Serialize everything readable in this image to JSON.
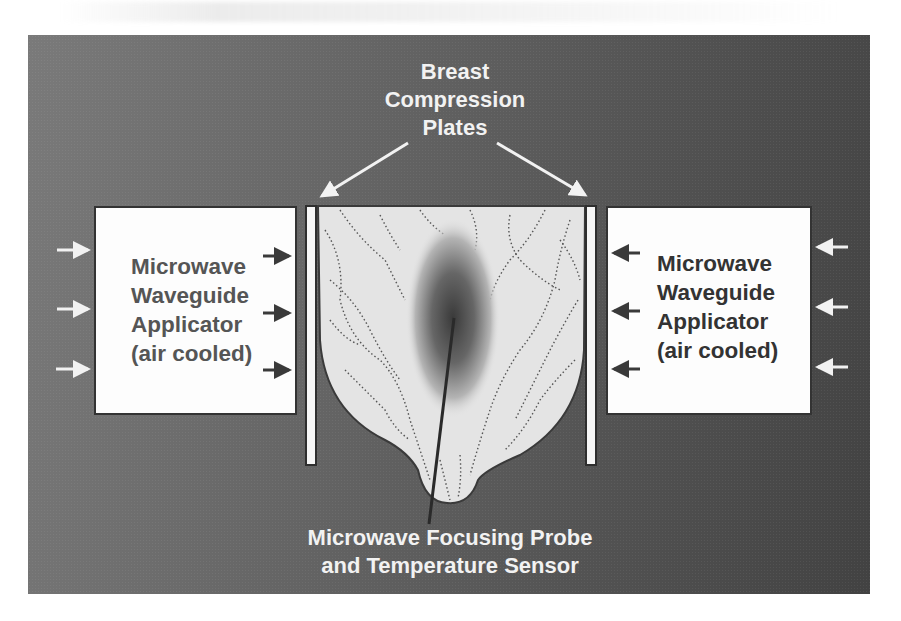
{
  "figure": {
    "title_lines": [
      "Breast",
      "Compression",
      "Plates"
    ],
    "left_applicator": {
      "lines": [
        "Microwave",
        "Waveguide",
        "Applicator",
        "(air cooled)"
      ]
    },
    "right_applicator": {
      "lines": [
        "Microwave",
        "Waveguide",
        "Applicator",
        "(air cooled)"
      ]
    },
    "probe_label_lines": [
      "Microwave Focusing Probe",
      "and Temperature Sensor"
    ],
    "colors": {
      "panel_light": "#7a7a7a",
      "panel_dark": "#424242",
      "label_white": "#f2f2f2",
      "box_fill": "#fdfdfd",
      "box_text_left": "#555555",
      "box_text_right": "#333333",
      "tissue_fill": "#e4e4e4",
      "focus_core": "#3a3a3a"
    },
    "icons": {
      "air_inflow_left": "arrow-right-white",
      "air_inflow_right": "arrow-left-white",
      "microwave_emission_left": "arrow-right-dark",
      "microwave_emission_right": "arrow-left-dark",
      "plate_pointer": "arrow-diagonal-white"
    }
  }
}
